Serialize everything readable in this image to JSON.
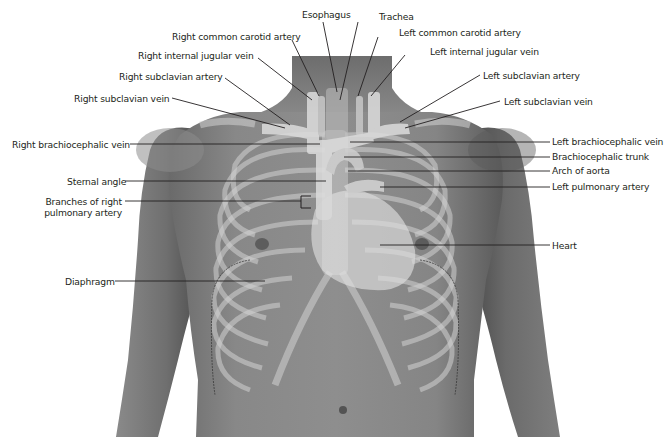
{
  "figure": {
    "type": "anatomical-illustration",
    "colors": {
      "background": "#ffffff",
      "skin_dark": "#5e5e5e",
      "skin_mid": "#7d7d7d",
      "bone_overlay": "#c9c9c9",
      "vessel_overlay": "#d9d9d9",
      "leader_line": "#231f20",
      "label_text": "#231f20"
    }
  },
  "labels": {
    "esophagus": "Esophagus",
    "trachea": "Trachea",
    "right_common_carotid_artery": "Right common carotid artery",
    "left_common_carotid_artery": "Left common carotid artery",
    "right_internal_jugular_vein": "Right internal jugular vein",
    "left_internal_jugular_vein": "Left internal jugular vein",
    "right_subclavian_artery": "Right subclavian artery",
    "left_subclavian_artery": "Left subclavian artery",
    "right_subclavian_vein": "Right subclavian vein",
    "left_subclavian_vein": "Left subclavian vein",
    "right_brachiocephalic_vein": "Right brachiocephalic vein",
    "left_brachiocephalic_vein": "Left brachiocephalic vein",
    "brachiocephalic_trunk": "Brachiocephalic trunk",
    "arch_of_aorta": "Arch of aorta",
    "sternal_angle": "Sternal angle",
    "left_pulmonary_artery": "Left pulmonary artery",
    "branches_of_right_pulmonary_artery_line1": "Branches of right",
    "branches_of_right_pulmonary_artery_line2": "pulmonary artery",
    "heart": "Heart",
    "diaphragm": "Diaphragm"
  }
}
